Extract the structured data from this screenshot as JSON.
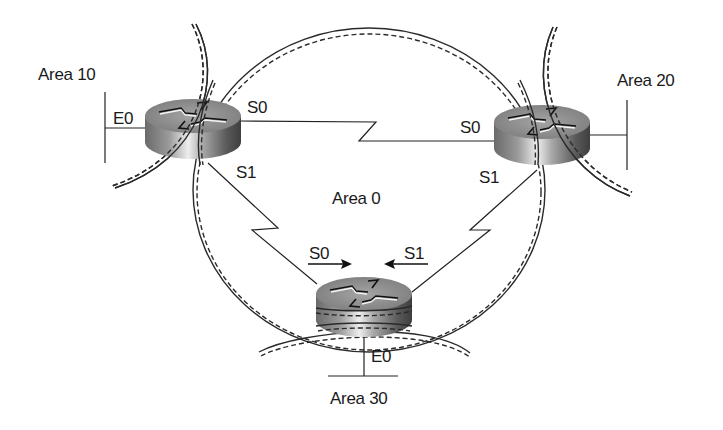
{
  "diagram": {
    "type": "OSPF multi-area topology",
    "areas": [
      {
        "id": "area-0",
        "label": "Area 0"
      },
      {
        "id": "area-10",
        "label": "Area 10"
      },
      {
        "id": "area-20",
        "label": "Area 20"
      },
      {
        "id": "area-30",
        "label": "Area 30"
      }
    ],
    "routers": [
      {
        "id": "router-area10",
        "icon": "router-icon",
        "interfaces": {
          "e0": "E0",
          "s0": "S0",
          "s1": "S1"
        }
      },
      {
        "id": "router-area20",
        "icon": "router-icon",
        "interfaces": {
          "s0": "S0",
          "s1": "S1"
        }
      },
      {
        "id": "router-area30",
        "icon": "router-icon",
        "interfaces": {
          "s0": "S0",
          "s1": "S1",
          "e0": "E0"
        }
      }
    ],
    "links": [
      {
        "from": "router-area10.S0",
        "to": "router-area20.S0",
        "type": "serial"
      },
      {
        "from": "router-area10.S1",
        "to": "router-area30.S0",
        "type": "serial"
      },
      {
        "from": "router-area20.S1",
        "to": "router-area30.S1",
        "type": "serial"
      },
      {
        "from": "router-area10.E0",
        "to": "area-10-lan",
        "type": "ethernet"
      },
      {
        "from": "router-area20",
        "to": "area-20-lan",
        "type": "ethernet"
      },
      {
        "from": "router-area30.E0",
        "to": "area-30-lan",
        "type": "ethernet"
      }
    ],
    "colors": {
      "line": "#2a2a2a",
      "text": "#1a1a1a",
      "background": "#ffffff"
    }
  }
}
